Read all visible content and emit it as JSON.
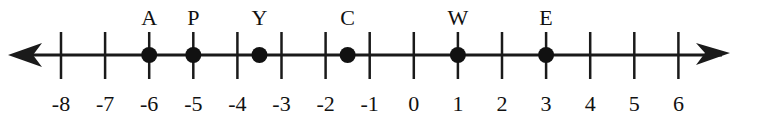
{
  "chart_data": {
    "type": "number_line",
    "title": "",
    "range": [
      -8,
      6
    ],
    "ticks": [
      -8,
      -7,
      -6,
      -5,
      -4,
      -3,
      -2,
      -1,
      0,
      1,
      2,
      3,
      4,
      5,
      6
    ],
    "tick_labels": [
      "-8",
      "-7",
      "-6",
      "-5",
      "-4",
      "-3",
      "-2",
      "-1",
      "0",
      "1",
      "2",
      "3",
      "4",
      "5",
      "6"
    ],
    "arrows": [
      "left",
      "right"
    ],
    "points": [
      {
        "label": "A",
        "value": -6
      },
      {
        "label": "P",
        "value": -5
      },
      {
        "label": "Y",
        "value": -3.5
      },
      {
        "label": "C",
        "value": -1.5
      },
      {
        "label": "W",
        "value": 1
      },
      {
        "label": "E",
        "value": 3
      }
    ]
  },
  "style": {
    "line_color": "#1a1a1a",
    "point_color": "#111111",
    "background": "#ffffff"
  }
}
